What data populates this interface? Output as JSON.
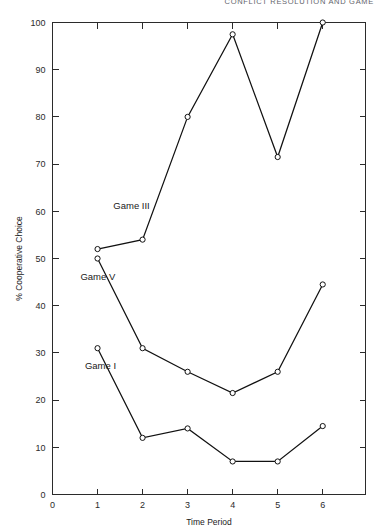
{
  "running_head": "CONFLICT RESOLUTION AND GAME",
  "chart_data": {
    "type": "line",
    "title": "",
    "xlabel": "Time Period",
    "ylabel": "% Cooperative Choice",
    "x": [
      1,
      2,
      3,
      4,
      5,
      6
    ],
    "xticklabels": [
      "0",
      "1",
      "2",
      "3",
      "4",
      "5",
      "6"
    ],
    "xlim": [
      0,
      6.95
    ],
    "ylim": [
      0,
      100
    ],
    "yticks": [
      0,
      10,
      20,
      30,
      40,
      50,
      60,
      70,
      80,
      90,
      100
    ],
    "yticklabels": [
      "0",
      "10",
      "20",
      "30",
      "40",
      "50",
      "60",
      "70",
      "80",
      "90",
      "100"
    ],
    "grid": false,
    "legend_position": "inline-annotations",
    "marker": "open-circle",
    "series": [
      {
        "name": "Game III",
        "label": "Game III",
        "values": [
          52,
          54,
          80,
          97.5,
          71.5,
          100
        ],
        "label_x": 1.35,
        "label_y": 60.5
      },
      {
        "name": "Game V",
        "label": "Game V",
        "values": [
          50,
          31,
          26,
          21.5,
          26,
          44.5
        ],
        "label_x": 0.62,
        "label_y": 45.5
      },
      {
        "name": "Game I",
        "label": "Game I",
        "values": [
          31,
          12,
          14,
          7,
          7,
          14.5
        ],
        "label_x": 0.72,
        "label_y": 26.5
      }
    ]
  }
}
